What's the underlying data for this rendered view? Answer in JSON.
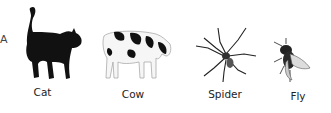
{
  "edge_letter": "A",
  "animals": [
    {
      "name": "Cat",
      "icon": "cat-icon"
    },
    {
      "name": "Cow",
      "icon": "cow-icon"
    },
    {
      "name": "Spider",
      "icon": "spider-icon"
    },
    {
      "name": "Fly",
      "icon": "fly-icon"
    }
  ]
}
